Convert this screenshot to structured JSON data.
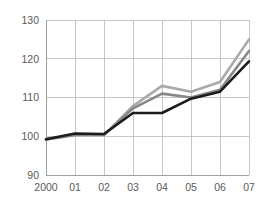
{
  "chart_data": {
    "type": "line",
    "title": "",
    "subtitle": "",
    "xlabel": "",
    "ylabel": "",
    "x": [
      "2000",
      "01",
      "02",
      "03",
      "04",
      "05",
      "06",
      "07"
    ],
    "categories": [
      "2000",
      "01",
      "02",
      "03",
      "04",
      "05",
      "06",
      "07"
    ],
    "xticklabels": [
      "2000",
      "01",
      "02",
      "03",
      "04",
      "05",
      "06",
      "07"
    ],
    "yticklabels": [
      "90",
      "100",
      "110",
      "120",
      "130"
    ],
    "yticks": [
      90,
      100,
      110,
      120,
      130
    ],
    "ylim": [
      90,
      130
    ],
    "grid": true,
    "legend": false,
    "legend_position": "none",
    "annotations": [],
    "series": [
      {
        "name": "series-light-gray",
        "color": "#a9a9a9",
        "width": 2.6,
        "values": [
          99.2,
          100.3,
          100.3,
          107.8,
          113.0,
          111.5,
          114.0,
          125.0
        ]
      },
      {
        "name": "series-medium-gray",
        "color": "#878787",
        "width": 2.6,
        "values": [
          99.2,
          100.4,
          100.4,
          107.2,
          111.0,
          110.0,
          112.0,
          122.0
        ]
      },
      {
        "name": "series-black",
        "color": "#1c1c1c",
        "width": 2.6,
        "values": [
          99.2,
          100.7,
          100.6,
          106.0,
          106.0,
          109.7,
          111.5,
          119.3
        ]
      }
    ]
  },
  "plot": {
    "left": 46,
    "right": 249,
    "top": 20,
    "bottom": 175
  }
}
